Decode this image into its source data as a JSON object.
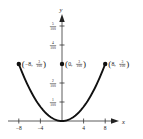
{
  "chart_data": {
    "type": "line",
    "title": "",
    "xlabel": "x",
    "ylabel": "y",
    "function": "y = 3x^2/6400",
    "xlim": [
      -10,
      10
    ],
    "ylim": [
      0,
      0.055
    ],
    "grid": false,
    "legend": null,
    "x_ticks": [
      {
        "value": -8,
        "label": "−8"
      },
      {
        "value": -4,
        "label": "−4"
      },
      {
        "value": 4,
        "label": "4"
      },
      {
        "value": 8,
        "label": "8"
      }
    ],
    "y_ticks": [
      {
        "value": 0.01,
        "num": "1",
        "den": "100"
      },
      {
        "value": 0.02,
        "num": "2",
        "den": "100"
      },
      {
        "value": 0.04,
        "num": "4",
        "den": "100"
      },
      {
        "value": 0.05,
        "num": "5",
        "den": "100"
      }
    ],
    "series": [
      {
        "name": "parabola",
        "x": [
          -8,
          -6,
          -4,
          -2,
          0,
          2,
          4,
          6,
          8
        ],
        "y": [
          0.03,
          0.016875,
          0.0075,
          0.001875,
          0,
          0.001875,
          0.0075,
          0.016875,
          0.03
        ]
      }
    ],
    "annotations": [
      {
        "x": -8,
        "y": 0.03,
        "label_x": "−8",
        "label_num": "3",
        "label_den": "100",
        "text": "(−8, 3/100)"
      },
      {
        "x": 0,
        "y": 0.03,
        "label_x": "0",
        "label_num": "3",
        "label_den": "100",
        "text": "(0, 3/100)"
      },
      {
        "x": 8,
        "y": 0.03,
        "label_x": "8",
        "label_num": "3",
        "label_den": "100",
        "text": "(8, 3/100)"
      }
    ]
  },
  "colors": {
    "curve": "#111111",
    "axis": "#333333",
    "background": "#ffffff"
  }
}
